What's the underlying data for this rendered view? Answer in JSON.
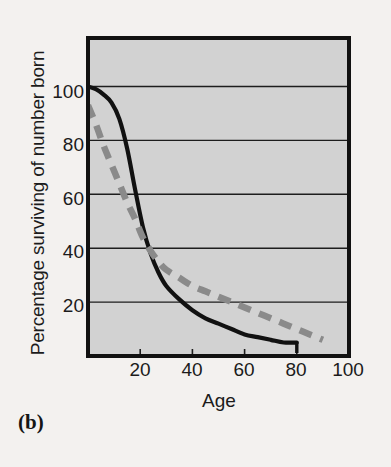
{
  "panel": {
    "label": "(b)"
  },
  "chart_data": {
    "type": "line",
    "title": "",
    "xlabel": "Age",
    "ylabel": "Percentage surviving of number born",
    "xlim": [
      0,
      100
    ],
    "ylim": [
      0,
      118
    ],
    "xticks": [
      20,
      40,
      60,
      80,
      100
    ],
    "yticks": [
      20,
      40,
      60,
      80,
      100
    ],
    "grid": "horizontal",
    "legend_position": "inline-annotation",
    "plot_background": "#d2d2d2",
    "page_background": "#f3f1ef",
    "series": [
      {
        "name": "Females",
        "style": "solid",
        "color": "#111111",
        "x": [
          0,
          3,
          6,
          9,
          12,
          15,
          18,
          21,
          24,
          27,
          30,
          35,
          40,
          45,
          50,
          55,
          60,
          65,
          70,
          75,
          80
        ],
        "values": [
          100,
          99,
          97,
          94,
          88,
          77,
          62,
          48,
          38,
          31,
          26,
          21,
          17,
          14,
          12,
          10,
          8,
          7,
          6,
          5,
          5
        ]
      },
      {
        "name": "Males",
        "style": "dashed",
        "color": "#8a8a8a",
        "x": [
          0,
          3,
          6,
          9,
          12,
          15,
          18,
          21,
          24,
          27,
          30,
          35,
          40,
          45,
          50,
          55,
          60,
          65,
          70,
          75,
          80,
          85,
          90
        ],
        "values": [
          93,
          86,
          78,
          71,
          64,
          57,
          51,
          44,
          39,
          35,
          32,
          29,
          26,
          24,
          22,
          20,
          18,
          16,
          14,
          12,
          10,
          8,
          6
        ]
      }
    ],
    "annotations": [
      {
        "text": "Females",
        "x": 13,
        "y": 90
      },
      {
        "text": "Males",
        "x": 62,
        "y": 21
      }
    ]
  },
  "axis": {
    "ytick_labels": [
      "100",
      "80",
      "60",
      "40",
      "20"
    ],
    "xtick_labels": [
      "20",
      "40",
      "60",
      "80",
      "100"
    ]
  }
}
